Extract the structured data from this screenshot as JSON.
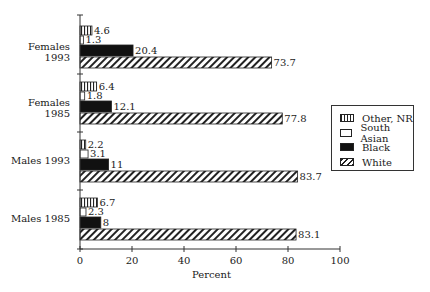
{
  "chart_data": {
    "type": "bar",
    "orientation": "horizontal",
    "title": "",
    "xlabel": "Percent",
    "ylabel": "",
    "xlim": [
      0,
      100
    ],
    "xticks": [
      0,
      20,
      40,
      60,
      80,
      100
    ],
    "grid": false,
    "legend_position": "right",
    "categories": [
      "Females 1993",
      "Females 1985",
      "Males 1993",
      "Males 1985"
    ],
    "series": [
      {
        "name": "Other, NR",
        "pattern": "vertical-lines",
        "values": [
          4.6,
          6.4,
          2.2,
          6.7
        ]
      },
      {
        "name": "South Asian",
        "pattern": "empty",
        "values": [
          1.3,
          1.8,
          3.1,
          2.3
        ]
      },
      {
        "name": "Black",
        "pattern": "solid",
        "values": [
          20.4,
          12.1,
          11,
          8
        ]
      },
      {
        "name": "White",
        "pattern": "diagonal-lines",
        "values": [
          73.7,
          77.8,
          83.7,
          83.1
        ]
      }
    ],
    "value_labels": [
      [
        "4.6",
        "1.3",
        "20.4",
        "73.7"
      ],
      [
        "6.4",
        "1.8",
        "12.1",
        "77.8"
      ],
      [
        "2.2",
        "3.1",
        "11",
        "83.7"
      ],
      [
        "6.7",
        "2.3",
        "8",
        "83.1"
      ]
    ]
  },
  "legend": {
    "items": [
      {
        "label": "Other, NR"
      },
      {
        "label": "South Asian"
      },
      {
        "label": "Black"
      },
      {
        "label": "White"
      }
    ]
  },
  "axis": {
    "tick_labels": [
      "0",
      "20",
      "40",
      "60",
      "80",
      "100"
    ],
    "xlabel": "Percent"
  },
  "colors": {
    "ink": "#1a1a1a",
    "background": "#ffffff"
  }
}
